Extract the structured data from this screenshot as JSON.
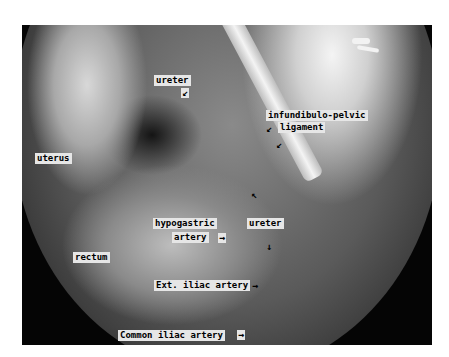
{
  "image": {
    "description": "Laparoscopic view of the female pelvis with anatomical labels",
    "frame_bg": "#050505",
    "label_bg": "#e6e6e6",
    "label_color": "#000000"
  },
  "labels": [
    {
      "id": "ureter_upper",
      "text": "ureter",
      "arrow": "↙"
    },
    {
      "id": "infundibulo_pelvic",
      "text": "infundibulo-pelvic",
      "arrow": ""
    },
    {
      "id": "ligament",
      "text": "ligament",
      "arrow": "↙"
    },
    {
      "id": "ligament_arrow2",
      "text": "",
      "arrow": "↙"
    },
    {
      "id": "uterus",
      "text": "uterus",
      "arrow": ""
    },
    {
      "id": "hypogastric",
      "text": "hypogastric",
      "arrow": ""
    },
    {
      "id": "hypogastric_artery",
      "text": "artery",
      "arrow": "→"
    },
    {
      "id": "ureter_lower",
      "text": "ureter",
      "arrow_up": "↖",
      "arrow_down": "↓"
    },
    {
      "id": "rectum",
      "text": "rectum",
      "arrow": ""
    },
    {
      "id": "ext_iliac",
      "text": "Ext. iliac artery",
      "arrow": "→"
    },
    {
      "id": "common_iliac",
      "text": "Common iliac artery",
      "arrow": "→"
    }
  ]
}
